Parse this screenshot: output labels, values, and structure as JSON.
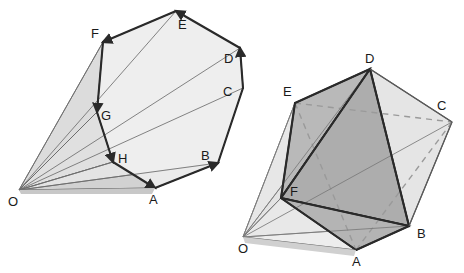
{
  "figure": {
    "kind": "geometry-diagram",
    "background_color": "#ffffff",
    "stroke_color": "#4a4a4a",
    "bold_stroke_color": "#2a2a2a",
    "dashed_stroke_color": "#9a9a9a",
    "label_color": "#1a1a1a",
    "fills": {
      "light": "#eaeaea",
      "light2": "#e2e2e2",
      "mid": "#d6d6d6",
      "mid2": "#cacaca",
      "dark": "#b4b4b4",
      "darker": "#a6a6a6"
    },
    "panels": [
      {
        "id": "left-panel",
        "name": "fan-cone-diagram",
        "apex_label": "O",
        "vertex_labels": [
          "O",
          "F",
          "E",
          "D",
          "C",
          "B",
          "A",
          "H",
          "G"
        ],
        "vertices": [
          {
            "label": "O",
            "x": 19,
            "y": 190,
            "label_x": 8,
            "label_y": 206
          },
          {
            "label": "F",
            "x": 103,
            "y": 42,
            "label_x": 91,
            "label_y": 38
          },
          {
            "label": "E",
            "x": 176,
            "y": 11,
            "label_x": 178,
            "label_y": 29
          },
          {
            "label": "D",
            "x": 240,
            "y": 48,
            "label_x": 224,
            "label_y": 63
          },
          {
            "label": "C",
            "x": 243,
            "y": 88,
            "label_x": 223,
            "label_y": 96
          },
          {
            "label": "B",
            "x": 218,
            "y": 163,
            "label_x": 201,
            "label_y": 160
          },
          {
            "label": "A",
            "x": 155,
            "y": 188,
            "label_x": 149,
            "label_y": 204
          },
          {
            "label": "H",
            "x": 113,
            "y": 162,
            "label_x": 118,
            "label_y": 163
          },
          {
            "label": "G",
            "x": 97,
            "y": 112,
            "label_x": 101,
            "label_y": 120
          }
        ],
        "rim_order": [
          "A",
          "B",
          "C",
          "D",
          "E",
          "F",
          "G",
          "H"
        ],
        "arrow_edges": [
          {
            "from": "A",
            "to": "B"
          },
          {
            "from": "C",
            "to": "D"
          },
          {
            "from": "D",
            "to": "E"
          },
          {
            "from": "E",
            "to": "F"
          },
          {
            "from": "F",
            "to": "G"
          },
          {
            "from": "G",
            "to": "H"
          },
          {
            "from": "H",
            "to": "A"
          }
        ]
      },
      {
        "id": "right-panel",
        "name": "octahedron-cone-diagram",
        "apex_label": "O",
        "vertex_labels": [
          "O",
          "D",
          "E",
          "C",
          "F",
          "B",
          "A"
        ],
        "vertices": [
          {
            "label": "O",
            "x": 243,
            "y": 237,
            "label_x": 238,
            "label_y": 253
          },
          {
            "label": "D",
            "x": 370,
            "y": 69,
            "label_x": 365,
            "label_y": 63
          },
          {
            "label": "E",
            "x": 295,
            "y": 103,
            "label_x": 283,
            "label_y": 96
          },
          {
            "label": "C",
            "x": 452,
            "y": 122,
            "label_x": 437,
            "label_y": 110
          },
          {
            "label": "F",
            "x": 281,
            "y": 198,
            "label_x": 290,
            "label_y": 196
          },
          {
            "label": "B",
            "x": 409,
            "y": 226,
            "label_x": 417,
            "label_y": 238
          },
          {
            "label": "A",
            "x": 356,
            "y": 250,
            "label_x": 352,
            "label_y": 266
          }
        ],
        "solid_edges": [
          {
            "from": "D",
            "to": "E"
          },
          {
            "from": "D",
            "to": "F"
          },
          {
            "from": "D",
            "to": "C"
          },
          {
            "from": "D",
            "to": "B"
          },
          {
            "from": "E",
            "to": "F"
          },
          {
            "from": "F",
            "to": "B"
          },
          {
            "from": "F",
            "to": "A"
          },
          {
            "from": "A",
            "to": "B"
          },
          {
            "from": "B",
            "to": "C"
          }
        ],
        "dashed_edges": [
          {
            "from": "E",
            "to": "C"
          },
          {
            "from": "E",
            "to": "A"
          },
          {
            "from": "A",
            "to": "C"
          }
        ]
      }
    ]
  }
}
